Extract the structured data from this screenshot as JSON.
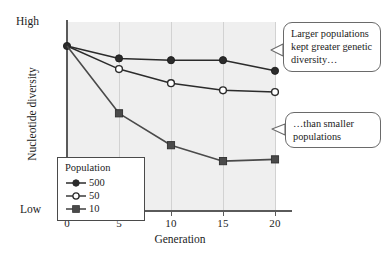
{
  "chart_data": {
    "type": "line",
    "title": "",
    "xlabel": "Generation",
    "ylabel": "Nucleotide diversity",
    "x": [
      0,
      5,
      10,
      15,
      20
    ],
    "xtick_labels": [
      "0",
      "5",
      "10",
      "15",
      "20"
    ],
    "ytick_labels": [
      "High",
      "Low"
    ],
    "ylim_labels": {
      "top": "High",
      "bottom": "Low"
    },
    "grid": "vertical",
    "legend_position": "inside-lower-left",
    "legend_title": "Population",
    "series": [
      {
        "name": "500",
        "marker": "filled-circle",
        "color": "#2b2b2b",
        "values": [
          1.0,
          0.93,
          0.92,
          0.92,
          0.86
        ]
      },
      {
        "name": "50",
        "marker": "open-circle",
        "color": "#2b2b2b",
        "values": [
          1.0,
          0.87,
          0.79,
          0.75,
          0.74
        ]
      },
      {
        "name": "10",
        "marker": "filled-square",
        "color": "#4a4a4a",
        "values": [
          1.0,
          0.62,
          0.44,
          0.35,
          0.36
        ]
      }
    ],
    "annotations": [
      {
        "id": "upper",
        "text": "Larger populations kept greater genetic diversity…",
        "points_to": "500-series-endpoint"
      },
      {
        "id": "lower",
        "text": "…than smaller populations",
        "points_to": "10-series-endpoint"
      }
    ]
  },
  "axis": {
    "y_top_label": "High",
    "y_bottom_label": "Low",
    "y_title": "Nucleotide diversity",
    "x_title": "Generation",
    "x_ticks": [
      "0",
      "5",
      "10",
      "15",
      "20"
    ]
  },
  "legend": {
    "title": "Population",
    "entries": [
      {
        "label": "500",
        "marker": "filled-circle"
      },
      {
        "label": "50",
        "marker": "open-circle"
      },
      {
        "label": "10",
        "marker": "filled-square"
      }
    ]
  },
  "callouts": {
    "upper": "Larger populations kept greater genetic diversity…",
    "lower": "…than smaller populations"
  },
  "colors": {
    "plot_background": "#efefef",
    "gridline": "#d2d2d2",
    "axis": "#5a5a5a",
    "series_dark": "#2b2b2b",
    "series_square": "#4a4a4a",
    "callout_border": "#6a6a6a",
    "page_background": "#ffffff"
  }
}
